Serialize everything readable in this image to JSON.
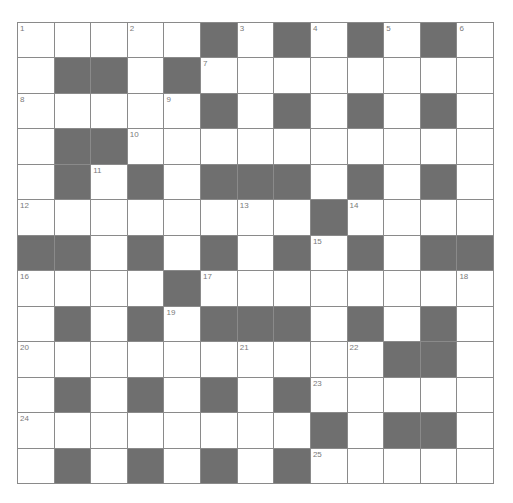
{
  "puzzle": {
    "rows": 13,
    "cols": 13,
    "colors": {
      "block": "#6f6f6f",
      "cell": "#ffffff",
      "gridline": "#8a8a8a",
      "number": "#7a7a7a"
    },
    "layout": [
      ".....#.#.#.#.",
      ".##.#........",
      ".....#.#.#.#.",
      ".##..........",
      ".#.#.###.#.#.",
      "........#....",
      "##.#.#.#.#.##",
      "....#........",
      ".#.#.###.#.#.",
      "..........##.",
      ".#.#.#.#.....",
      "........#.##.",
      ".#.#.#.#....."
    ],
    "numbers": [
      {
        "n": "1",
        "r": 0,
        "c": 0
      },
      {
        "n": "2",
        "r": 0,
        "c": 3
      },
      {
        "n": "3",
        "r": 0,
        "c": 6
      },
      {
        "n": "4",
        "r": 0,
        "c": 8
      },
      {
        "n": "5",
        "r": 0,
        "c": 10
      },
      {
        "n": "6",
        "r": 0,
        "c": 12
      },
      {
        "n": "7",
        "r": 1,
        "c": 5
      },
      {
        "n": "8",
        "r": 2,
        "c": 0
      },
      {
        "n": "9",
        "r": 2,
        "c": 4
      },
      {
        "n": "10",
        "r": 3,
        "c": 3
      },
      {
        "n": "11",
        "r": 4,
        "c": 2
      },
      {
        "n": "12",
        "r": 5,
        "c": 0
      },
      {
        "n": "13",
        "r": 5,
        "c": 6
      },
      {
        "n": "14",
        "r": 5,
        "c": 9
      },
      {
        "n": "15",
        "r": 6,
        "c": 8
      },
      {
        "n": "16",
        "r": 7,
        "c": 0
      },
      {
        "n": "17",
        "r": 7,
        "c": 5
      },
      {
        "n": "18",
        "r": 7,
        "c": 12
      },
      {
        "n": "19",
        "r": 8,
        "c": 4
      },
      {
        "n": "20",
        "r": 9,
        "c": 0
      },
      {
        "n": "21",
        "r": 9,
        "c": 6
      },
      {
        "n": "22",
        "r": 9,
        "c": 9
      },
      {
        "n": "23",
        "r": 10,
        "c": 8
      },
      {
        "n": "24",
        "r": 11,
        "c": 0
      },
      {
        "n": "25",
        "r": 12,
        "c": 8
      }
    ],
    "letters": []
  }
}
